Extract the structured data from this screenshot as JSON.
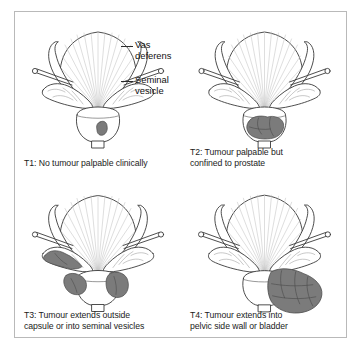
{
  "figure": {
    "border_color": "#b9b9b9",
    "background": "#ffffff"
  },
  "colors": {
    "outline": "#3a3a3a",
    "fan_line": "#c2c2c2",
    "tumour_fill": "#7b7b7b",
    "tumour_stroke": "#4a4a4a",
    "organ_fill": "#ffffff",
    "text": "#1b1b1b",
    "leader": "#2b2b2b"
  },
  "annotations": {
    "vas_deferens": {
      "line1": "Vas",
      "line2": "deferens",
      "leader_icon": "leader-dash-icon"
    },
    "seminal_vesicle": {
      "line1": "Seminal",
      "line2": "vesicle",
      "leader_icon": "leader-dash-icon"
    }
  },
  "panels": [
    {
      "id": "T1",
      "stage": "T1",
      "caption": "T1: No tumour palpable clinically",
      "caption_line1": "T1: No tumour palpable clinically",
      "caption_line2": "",
      "tumour_description": "small single nodule inside prostate",
      "tumour_count": 1
    },
    {
      "id": "T2",
      "stage": "T2",
      "caption": "T2: Tumour palpable but confined to prostate",
      "caption_line1": "T2: Tumour palpable but",
      "caption_line2": "confined to prostate",
      "tumour_description": "large lobulated mass filling prostate, confined within capsule",
      "tumour_count": 1
    },
    {
      "id": "T3",
      "stage": "T3",
      "caption": "T3: Tumour extends outside capsule or into seminal vesicles",
      "caption_line1": "T3: Tumour extends outside",
      "caption_line2": "capsule or into seminal vesicles",
      "tumour_description": "masses extending into left seminal vesicle and through capsule on both sides",
      "tumour_count": 3
    },
    {
      "id": "T4",
      "stage": "T4",
      "caption": "T4: Tumour extends into pelvic side wall or bladder",
      "caption_line1": "T4: Tumour extends into",
      "caption_line2": "pelvic side wall or bladder",
      "tumour_description": "very large mass extending laterally beyond prostate to pelvic side wall",
      "tumour_count": 1
    }
  ],
  "anatomy_parts": [
    "bladder",
    "vas-deferens-left",
    "vas-deferens-right",
    "seminal-vesicle-left",
    "seminal-vesicle-right",
    "prostate",
    "urethra"
  ]
}
